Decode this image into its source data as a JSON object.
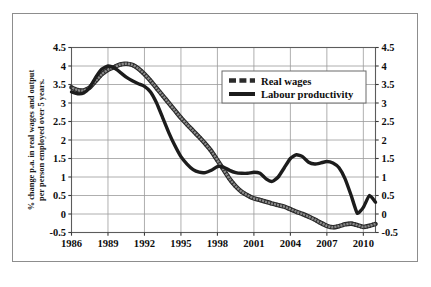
{
  "chart_data": {
    "type": "line",
    "title": "",
    "xlabel": "",
    "ylabel": "% change p.a. in real wages and output per person employed over 5 years.",
    "xlim": [
      1986,
      2011
    ],
    "ylim": [
      -0.5,
      4.5
    ],
    "grid": true,
    "legend_position": "upper-center-right",
    "y_ticks": [
      "4.5",
      "4",
      "3.5",
      "3",
      "2.5",
      "2",
      "1.5",
      "1",
      "0.5",
      "0",
      "-0.5"
    ],
    "y_tick_values": [
      4.5,
      4,
      3.5,
      3,
      2.5,
      2,
      1.5,
      1,
      0.5,
      0,
      -0.5
    ],
    "y_axis_right_ticks": [
      "4.5",
      "4",
      "3.5",
      "3",
      "2.5",
      "2",
      "1.5",
      "1",
      "0.5",
      "0",
      "-0.5"
    ],
    "x_ticks": [
      "1986",
      "1989",
      "1992",
      "1995",
      "1998",
      "2001",
      "2004",
      "2007",
      "2010"
    ],
    "x_tick_values": [
      1986,
      1989,
      1992,
      1995,
      1998,
      2001,
      2004,
      2007,
      2010
    ],
    "x": [
      1986,
      1986.5,
      1987,
      1987.5,
      1988,
      1988.5,
      1989,
      1989.5,
      1990,
      1990.5,
      1991,
      1991.5,
      1992,
      1992.5,
      1993,
      1993.5,
      1994,
      1994.5,
      1995,
      1995.5,
      1996,
      1996.5,
      1997,
      1997.5,
      1998,
      1998.5,
      1999,
      1999.5,
      2000,
      2000.5,
      2001,
      2001.5,
      2002,
      2002.5,
      2003,
      2003.5,
      2004,
      2004.5,
      2005,
      2005.5,
      2006,
      2006.5,
      2007,
      2007.5,
      2008,
      2008.5,
      2009,
      2009.5,
      2010,
      2010.5,
      2011
    ],
    "series": [
      {
        "name": "Real wages",
        "color": "#8a8a8a",
        "outline_color": "#2b2b2b",
        "style": "beaded-dashed",
        "values": [
          3.42,
          3.35,
          3.34,
          3.42,
          3.6,
          3.78,
          3.9,
          3.97,
          4.04,
          4.06,
          4.03,
          3.93,
          3.78,
          3.6,
          3.4,
          3.2,
          3.0,
          2.8,
          2.6,
          2.42,
          2.25,
          2.08,
          1.9,
          1.7,
          1.45,
          1.2,
          0.95,
          0.75,
          0.6,
          0.5,
          0.42,
          0.38,
          0.33,
          0.28,
          0.24,
          0.2,
          0.13,
          0.06,
          0.0,
          -0.07,
          -0.15,
          -0.24,
          -0.32,
          -0.36,
          -0.33,
          -0.28,
          -0.26,
          -0.3,
          -0.35,
          -0.32,
          -0.27
        ]
      },
      {
        "name": "Labour productivity",
        "color": "#1c1c1c",
        "outline_color": "#1c1c1c",
        "style": "solid",
        "values": [
          3.3,
          3.25,
          3.27,
          3.42,
          3.7,
          3.92,
          4.0,
          3.95,
          3.83,
          3.7,
          3.6,
          3.52,
          3.45,
          3.3,
          3.0,
          2.6,
          2.2,
          1.85,
          1.55,
          1.35,
          1.2,
          1.13,
          1.12,
          1.18,
          1.28,
          1.27,
          1.18,
          1.12,
          1.1,
          1.1,
          1.13,
          1.1,
          0.95,
          0.88,
          1.0,
          1.25,
          1.5,
          1.6,
          1.55,
          1.4,
          1.35,
          1.38,
          1.42,
          1.38,
          1.25,
          0.95,
          0.5,
          0.02,
          0.18,
          0.5,
          0.32
        ]
      }
    ]
  },
  "legend": {
    "items": [
      {
        "label": "Real wages"
      },
      {
        "label": "Labour productivity"
      }
    ]
  }
}
